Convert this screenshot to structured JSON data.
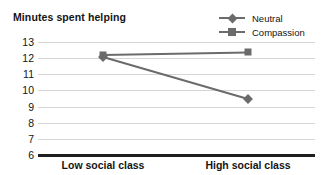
{
  "chart_data": {
    "type": "line",
    "title": "Minutes spent helping",
    "xlabel": "",
    "ylabel": "Minutes spent helping",
    "categories": [
      "Low social class",
      "High social class"
    ],
    "series": [
      {
        "name": "Neutral",
        "marker": "diamond",
        "color": "#6b6b6b",
        "values": [
          12.05,
          9.45
        ]
      },
      {
        "name": "Compassion",
        "marker": "square",
        "color": "#6b6b6b",
        "values": [
          12.2,
          12.35
        ]
      }
    ],
    "ylim": [
      6,
      13
    ],
    "yticks": [
      13,
      12,
      11,
      10,
      9,
      8,
      7,
      6
    ],
    "ytick_labels": [
      "13",
      "12",
      "11",
      "10",
      "9",
      "8",
      "7",
      "6"
    ],
    "grid": true,
    "legend_position": "top-right",
    "legend": [
      "Neutral",
      "Compassion"
    ],
    "axis_color": "#1f1f1f",
    "grid_color": "#d6d6d6"
  },
  "legend": {
    "items": [
      {
        "label": "Neutral",
        "icon": "diamond-marker-icon"
      },
      {
        "label": "Compassion",
        "icon": "square-marker-icon"
      }
    ]
  },
  "axes": {
    "y_tick_labels": [
      "13",
      "12",
      "11",
      "10",
      "9",
      "8",
      "7",
      "6"
    ],
    "x_tick_labels": [
      "Low social class",
      "High social class"
    ]
  },
  "title": "Minutes spent helping"
}
